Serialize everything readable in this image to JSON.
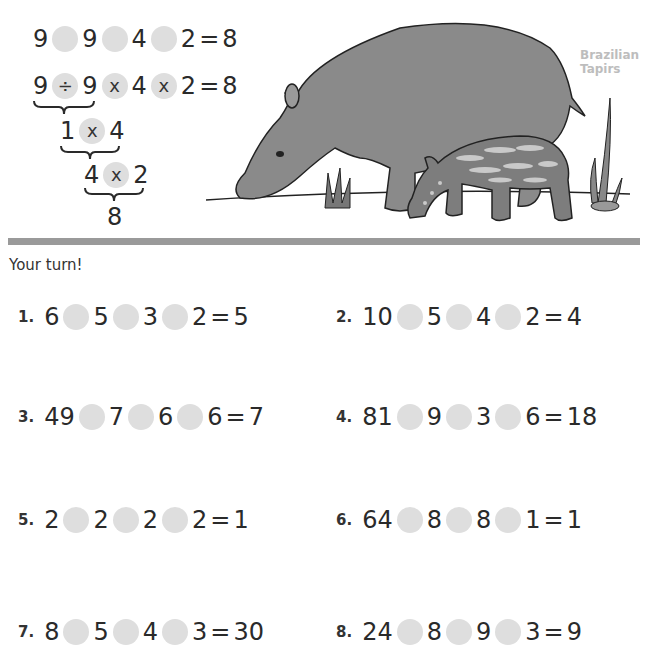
{
  "example": {
    "problem": {
      "terms": [
        "9",
        "9",
        "4",
        "2"
      ],
      "result": "8"
    },
    "solution": {
      "terms": [
        "9",
        "9",
        "4",
        "2"
      ],
      "ops": [
        "÷",
        "x",
        "x"
      ],
      "result": "8"
    },
    "step1": {
      "terms": [
        "1",
        "4"
      ],
      "op": "x"
    },
    "step2": {
      "terms": [
        "4",
        "2"
      ],
      "op": "x"
    },
    "final": "8"
  },
  "illustration": {
    "caption_line1": "Brazilian",
    "caption_line2": "Tapirs",
    "subject": "adult and baby tapir"
  },
  "colors": {
    "circle": "#dedede",
    "divider": "#9a9a9a",
    "caption": "#bdbdbd",
    "tapir_adult": "#8a8a8a",
    "tapir_baby": "#7d7d7d"
  },
  "prompt": "Your turn!",
  "problems": [
    {
      "number": "1.",
      "terms": [
        "6",
        "5",
        "3",
        "2"
      ],
      "result": "5"
    },
    {
      "number": "2.",
      "terms": [
        "10",
        "5",
        "4",
        "2"
      ],
      "result": "4"
    },
    {
      "number": "3.",
      "terms": [
        "49",
        "7",
        "6",
        "6"
      ],
      "result": "7"
    },
    {
      "number": "4.",
      "terms": [
        "81",
        "9",
        "3",
        "6"
      ],
      "result": "18"
    },
    {
      "number": "5.",
      "terms": [
        "2",
        "2",
        "2",
        "2"
      ],
      "result": "1"
    },
    {
      "number": "6.",
      "terms": [
        "64",
        "8",
        "8",
        "1"
      ],
      "result": "1"
    },
    {
      "number": "7.",
      "terms": [
        "8",
        "5",
        "4",
        "3"
      ],
      "result": "30"
    },
    {
      "number": "8.",
      "terms": [
        "24",
        "8",
        "9",
        "3"
      ],
      "result": "9"
    }
  ]
}
